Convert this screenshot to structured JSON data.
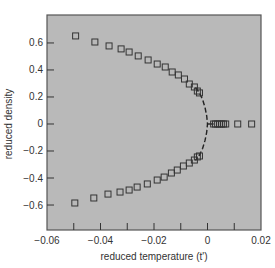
{
  "chart_data": {
    "type": "scatter",
    "title": "",
    "xlabel": "reduced temperature (t')",
    "ylabel": "reduced density",
    "xlim": [
      -0.06,
      0.02
    ],
    "ylim": [
      -0.785,
      0.807
    ],
    "xticks": [
      -0.06,
      -0.04,
      -0.02,
      0,
      0.02
    ],
    "xtick_labels": [
      "−0.06",
      "−0.04",
      "−0.02",
      "0",
      "0.02"
    ],
    "xminor_ticks": [
      -0.05,
      -0.04,
      -0.03,
      -0.02,
      -0.01,
      0,
      0.01
    ],
    "yticks": [
      0.6,
      0.4,
      0.2,
      0,
      -0.2,
      -0.4,
      -0.6
    ],
    "ytick_labels": [
      "0.6",
      "0.4",
      "0.2",
      "0",
      "−0.2",
      "−0.4",
      "−0.6"
    ],
    "grid": false,
    "legend": null,
    "background_color": "#b9b9b9",
    "marker": "open-square",
    "series": [
      {
        "name": "upper branch",
        "marker": "square-open",
        "x": [
          -0.0493,
          -0.0421,
          -0.0368,
          -0.0323,
          -0.0293,
          -0.0259,
          -0.0222,
          -0.0188,
          -0.0158,
          -0.0132,
          -0.0109,
          -0.0086,
          -0.0068,
          -0.0049,
          -0.0038,
          -0.003
        ],
        "y": [
          0.652,
          0.607,
          0.578,
          0.556,
          0.533,
          0.504,
          0.474,
          0.444,
          0.422,
          0.385,
          0.363,
          0.333,
          0.296,
          0.274,
          0.244,
          0.23
        ]
      },
      {
        "name": "lower branch",
        "marker": "square-open",
        "x": [
          -0.0496,
          -0.0425,
          -0.0372,
          -0.0327,
          -0.0293,
          -0.0263,
          -0.0225,
          -0.0188,
          -0.0162,
          -0.0135,
          -0.0113,
          -0.009,
          -0.0068,
          -0.0049,
          -0.0038,
          -0.003
        ],
        "y": [
          -0.585,
          -0.548,
          -0.519,
          -0.504,
          -0.489,
          -0.467,
          -0.444,
          -0.415,
          -0.393,
          -0.363,
          -0.341,
          -0.311,
          -0.289,
          -0.267,
          -0.244,
          -0.237
        ]
      },
      {
        "name": "zero density line",
        "marker": "square-open",
        "x": [
          0.0023,
          0.003,
          0.0038,
          0.0045,
          0.0053,
          0.006,
          0.0068,
          0.0113,
          0.0165
        ],
        "y": [
          0,
          0,
          0,
          0,
          0,
          0,
          0,
          0,
          0
        ]
      },
      {
        "name": "coexistence curve fit",
        "style": "dashed",
        "x": [
          -0.0045,
          -0.003,
          -0.0018,
          -0.0009,
          -0.0003,
          0.0,
          -0.0003,
          -0.0009,
          -0.0018,
          -0.003,
          -0.0045
        ],
        "y": [
          0.27,
          0.23,
          0.18,
          0.12,
          0.06,
          0.0,
          -0.06,
          -0.12,
          -0.18,
          -0.23,
          -0.27
        ]
      },
      {
        "name": "connector",
        "style": "solid",
        "x": [
          0.0,
          0.0023
        ],
        "y": [
          0,
          0
        ]
      }
    ]
  }
}
